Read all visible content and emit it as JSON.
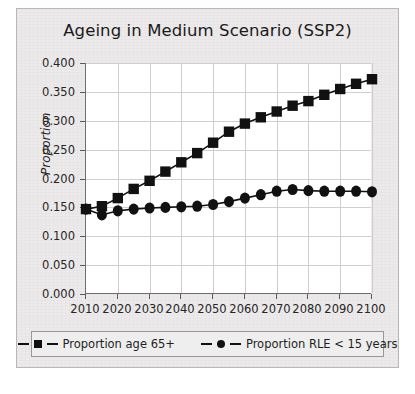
{
  "figure": {
    "title": "Ageing in Medium Scenario (SSP2)",
    "ylabel": "Proportion",
    "background_color": "#eceaea",
    "plot_color": "#ffffff",
    "ink_color": "#111111"
  },
  "legend": {
    "entries": [
      {
        "label": "Proportion age 65+",
        "marker": "square-marker"
      },
      {
        "label": "Proportion RLE < 15 years",
        "marker": "circle-marker"
      }
    ]
  },
  "chart_data": {
    "type": "line",
    "title": "Ageing in Medium Scenario (SSP2)",
    "xlabel": "",
    "ylabel": "Proportion",
    "xlim": [
      2010,
      2100
    ],
    "ylim": [
      0.0,
      0.4
    ],
    "grid": true,
    "legend_position": "bottom",
    "x": [
      2010,
      2015,
      2020,
      2025,
      2030,
      2035,
      2040,
      2045,
      2050,
      2055,
      2060,
      2065,
      2070,
      2075,
      2080,
      2085,
      2090,
      2095,
      2100
    ],
    "xticks": [
      2010,
      2020,
      2030,
      2040,
      2050,
      2060,
      2070,
      2080,
      2090,
      2100
    ],
    "xtick_labels": [
      "2010",
      "2020",
      "2030",
      "2040",
      "2050",
      "2060",
      "2070",
      "2080",
      "2090",
      "2100"
    ],
    "yticks": [
      0.0,
      0.05,
      0.1,
      0.15,
      0.2,
      0.25,
      0.3,
      0.35,
      0.4
    ],
    "ytick_labels": [
      "0.000",
      "0.050",
      "0.100",
      "0.150",
      "0.200",
      "0.250",
      "0.300",
      "0.350",
      "0.400"
    ],
    "series": [
      {
        "name": "Proportion age 65+",
        "marker": "square",
        "values": [
          0.147,
          0.152,
          0.166,
          0.182,
          0.196,
          0.212,
          0.228,
          0.244,
          0.262,
          0.281,
          0.295,
          0.306,
          0.316,
          0.326,
          0.334,
          0.345,
          0.355,
          0.364,
          0.372
        ]
      },
      {
        "name": "Proportion RLE < 15 years",
        "marker": "circle",
        "values": [
          0.147,
          0.137,
          0.144,
          0.147,
          0.149,
          0.15,
          0.151,
          0.152,
          0.155,
          0.16,
          0.166,
          0.172,
          0.178,
          0.181,
          0.179,
          0.178,
          0.178,
          0.178,
          0.177
        ]
      }
    ]
  }
}
